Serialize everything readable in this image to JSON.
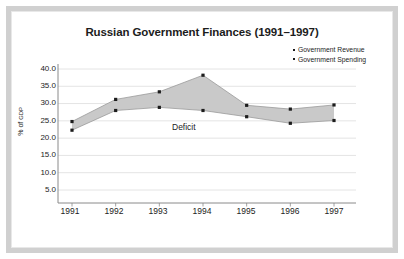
{
  "frame": {
    "border_color": "#d0d0d0",
    "background": "#ffffff"
  },
  "chart_title": "Russian Government Finances (1991–1997)",
  "legend": {
    "items": [
      {
        "label": "Government Revenue",
        "color": "#1c1c1c"
      },
      {
        "label": "Government Spending",
        "color": "#1c1c1c"
      }
    ]
  },
  "annotations": {
    "deficit_label": "Deficit"
  },
  "axis": {
    "ylabel_main": "% of ",
    "ylabel_sub": "GDP",
    "ytick_labels": [
      "40.0",
      "35.0",
      "30.0",
      "25.0",
      "20.0",
      "15.0",
      "10.0",
      "5.0"
    ],
    "xtick_labels": [
      "1991",
      "1992",
      "1993",
      "1994",
      "1995",
      "1996",
      "1997"
    ]
  },
  "colors": {
    "band_fill": "#c9c9c9",
    "gridline": "#e4e4e4",
    "axis_line": "#8a8a8a",
    "marker": "#1c1c1c",
    "text": "#1c1c1c"
  },
  "chart_data": {
    "type": "area",
    "title": "Russian Government Finances (1991–1997)",
    "xlabel": "",
    "ylabel": "% of GDP",
    "categories": [
      "1991",
      "1992",
      "1993",
      "1994",
      "1995",
      "1996",
      "1997"
    ],
    "x": [
      1991,
      1992,
      1993,
      1994,
      1995,
      1996,
      1997
    ],
    "series": [
      {
        "name": "Government Revenue",
        "values": [
          22.3,
          28.0,
          28.9,
          28.0,
          26.2,
          24.3,
          25.1
        ]
      },
      {
        "name": "Government Spending",
        "values": [
          24.8,
          31.2,
          33.4,
          38.2,
          29.5,
          28.4,
          29.6
        ]
      }
    ],
    "shaded_region": {
      "label": "Deficit",
      "between": [
        "Government Revenue",
        "Government Spending"
      ],
      "fill": "#c9c9c9"
    },
    "ylim": [
      0,
      40
    ],
    "yticks": [
      5.0,
      10.0,
      15.0,
      20.0,
      25.0,
      30.0,
      35.0,
      40.0
    ],
    "grid": true,
    "legend_position": "top-right"
  }
}
